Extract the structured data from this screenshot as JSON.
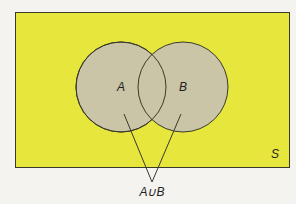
{
  "diagram": {
    "type": "venn",
    "universe_label": "S",
    "sets": [
      {
        "label": "A",
        "cx": 121,
        "cy": 87,
        "r": 45
      },
      {
        "label": "B",
        "cx": 183,
        "cy": 87,
        "r": 45
      }
    ],
    "callout_label": "A∪B",
    "colors": {
      "universe_fill": "#e6e63c",
      "set_fill": "#c9c5a6",
      "stroke": "#3a3a2a",
      "background": "#f4f3ef"
    }
  }
}
